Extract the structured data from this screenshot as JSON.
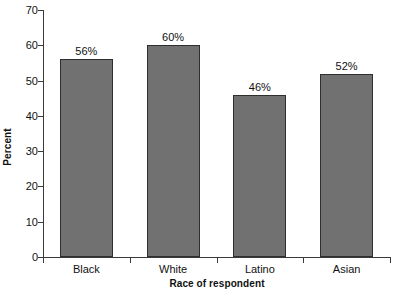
{
  "chart_data": {
    "type": "bar",
    "title": "",
    "subtitle": "",
    "categories": [
      "Black",
      "White",
      "Latino",
      "Asian"
    ],
    "values": [
      56,
      60,
      46,
      52
    ],
    "data_labels": [
      "56%",
      "60%",
      "46%",
      "52%"
    ],
    "xlabel": "Race of respondent",
    "ylabel": "Percent",
    "ylim": [
      0,
      70
    ],
    "ytick_values": [
      0,
      10,
      20,
      30,
      40,
      50,
      60,
      70
    ],
    "ytick_labels": [
      "0",
      "10",
      "20",
      "30",
      "40",
      "50",
      "60",
      "70"
    ],
    "grid": false,
    "legend": false,
    "legend_position": "none",
    "bar_color": "#717171",
    "bar_edge_color": "#2e2e2e",
    "axis_color": "#3a3a3a",
    "background_color": "#ffffff",
    "text_color": "#111111"
  }
}
